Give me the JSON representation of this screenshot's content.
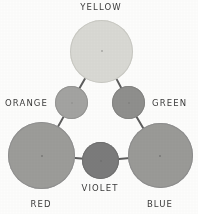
{
  "figure": {
    "background_color": "#fdfdfc",
    "line_color": "#5d5d5d",
    "label_color": "#3b3b3b"
  },
  "swatches": [
    {
      "id": "yellow",
      "label": "YELLOW",
      "category": "primary",
      "fill": "#d9d9d4",
      "edge": "#c9c9c3",
      "cx": 101.5,
      "cy": 51,
      "d": 63
    },
    {
      "id": "orange",
      "label": "ORANGE",
      "category": "secondary",
      "fill": "#a3a3a1",
      "edge": "#959593",
      "cx": 71.5,
      "cy": 102.5,
      "d": 33
    },
    {
      "id": "green",
      "label": "GREEN",
      "category": "secondary",
      "fill": "#8f8f8d",
      "edge": "#848482",
      "cx": 128.5,
      "cy": 102.5,
      "d": 33
    },
    {
      "id": "red",
      "label": "RED",
      "category": "primary",
      "fill": "#9c9c99",
      "edge": "#909090",
      "cx": 41.5,
      "cy": 155.5,
      "d": 67
    },
    {
      "id": "violet",
      "label": "VIOLET",
      "category": "secondary",
      "fill": "#7b7b7b",
      "edge": "#6f6f6f",
      "cx": 100.5,
      "cy": 160.5,
      "d": 37
    },
    {
      "id": "blue",
      "label": "BLUE",
      "category": "primary",
      "fill": "#9a9a97",
      "edge": "#8e8e8e",
      "cx": 160,
      "cy": 155.5,
      "d": 65
    }
  ],
  "links": [
    {
      "id": "yellow-orange",
      "from": "yellow",
      "to": "orange"
    },
    {
      "id": "yellow-green",
      "from": "yellow",
      "to": "green"
    },
    {
      "id": "orange-red",
      "from": "orange",
      "to": "red"
    },
    {
      "id": "green-blue",
      "from": "green",
      "to": "blue"
    },
    {
      "id": "red-violet",
      "from": "red",
      "to": "violet"
    },
    {
      "id": "violet-blue",
      "from": "violet",
      "to": "blue"
    }
  ],
  "labels": [
    {
      "id": "yellow",
      "text": "YELLOW",
      "x": 101,
      "y": 3,
      "align": "c"
    },
    {
      "id": "orange",
      "text": "ORANGE",
      "x": 48,
      "y": 99,
      "align": "r"
    },
    {
      "id": "green",
      "text": "GREEN",
      "x": 152,
      "y": 99,
      "align": "l"
    },
    {
      "id": "red",
      "text": "RED",
      "x": 41,
      "y": 200,
      "align": "c"
    },
    {
      "id": "violet",
      "text": "VIOLET",
      "x": 100,
      "y": 184,
      "align": "c"
    },
    {
      "id": "blue",
      "text": "BLUE",
      "x": 160,
      "y": 200,
      "align": "c"
    }
  ]
}
